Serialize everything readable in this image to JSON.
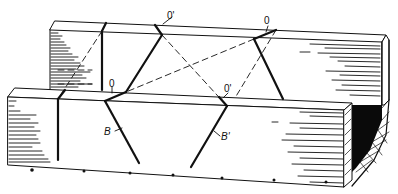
{
  "diagram": {
    "type": "mitre-box-isometric",
    "labels": {
      "back_left_top": "0'",
      "back_right_top": "0",
      "front_left_top": "0",
      "front_right_top": "0'",
      "front_cut_left": "B",
      "front_cut_right": "B'"
    },
    "colors": {
      "ink": "#111111",
      "paper": "#ffffff",
      "shadow": "#0a0a0a"
    },
    "guide_dots_count": 6
  }
}
